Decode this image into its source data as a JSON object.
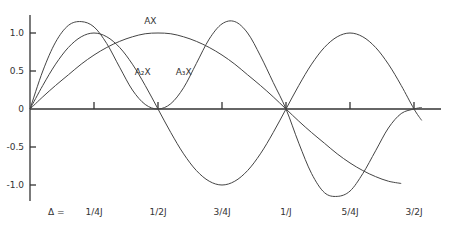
{
  "chart_data": {
    "type": "line",
    "title": "",
    "xlabel": "Δ =",
    "ylabel": "",
    "x_tick_labels": [
      "1/4J",
      "1/2J",
      "3/4J",
      "1/J",
      "5/4J",
      "3/2J"
    ],
    "x_ticks": [
      0.25,
      0.5,
      0.75,
      1.0,
      1.25,
      1.5
    ],
    "y_tick_labels": [
      "1.0",
      "0.5",
      "0",
      "-0.5",
      "-1.0"
    ],
    "y_ticks": [
      1.0,
      0.5,
      0,
      -0.5,
      -1.0
    ],
    "xlim": [
      0,
      1.6
    ],
    "ylim": [
      -1.2,
      1.2
    ],
    "grid": false,
    "legend": "inline",
    "annotations": [
      {
        "text": "AX",
        "x": 0.47,
        "y": 1.12
      },
      {
        "text": "A₂X",
        "x": 0.44,
        "y": 0.45
      },
      {
        "text": "A₃X",
        "x": 0.6,
        "y": 0.45
      }
    ],
    "x": [
      0,
      0.05,
      0.1,
      0.15,
      0.2,
      0.25,
      0.3,
      0.35,
      0.4,
      0.45,
      0.5,
      0.55,
      0.6,
      0.65,
      0.7,
      0.75,
      0.8,
      0.85,
      0.9,
      0.95,
      1.0,
      1.05,
      1.1,
      1.15,
      1.2,
      1.25,
      1.3,
      1.35,
      1.4,
      1.45,
      1.5,
      1.53
    ],
    "series": [
      {
        "name": "AX",
        "values": [
          0,
          0.16,
          0.31,
          0.45,
          0.59,
          0.71,
          0.81,
          0.89,
          0.95,
          0.99,
          1.0,
          0.99,
          0.95,
          0.89,
          0.81,
          0.71,
          0.59,
          0.45,
          0.31,
          0.16,
          0,
          -0.16,
          -0.31,
          -0.45,
          -0.59,
          -0.71,
          -0.81,
          -0.89,
          -0.95,
          -0.98,
          null,
          null
        ]
      },
      {
        "name": "A2X",
        "values": [
          0,
          0.31,
          0.59,
          0.81,
          0.95,
          1.0,
          0.95,
          0.81,
          0.59,
          0.31,
          0,
          -0.31,
          -0.59,
          -0.81,
          -0.95,
          -1.0,
          -0.95,
          -0.81,
          -0.59,
          -0.31,
          0,
          0.31,
          0.59,
          0.81,
          0.95,
          1.0,
          0.95,
          0.81,
          0.59,
          0.31,
          0,
          -0.15
        ]
      },
      {
        "name": "A3X",
        "values": [
          0,
          0.5,
          0.88,
          1.1,
          1.15,
          1.08,
          0.86,
          0.55,
          0.25,
          0.06,
          0,
          0.07,
          0.28,
          0.6,
          0.92,
          1.12,
          1.15,
          1.0,
          0.7,
          0.35,
          0,
          -0.45,
          -0.85,
          -1.1,
          -1.15,
          -1.08,
          -0.85,
          -0.55,
          -0.25,
          -0.06,
          0,
          0.02
        ]
      }
    ]
  }
}
